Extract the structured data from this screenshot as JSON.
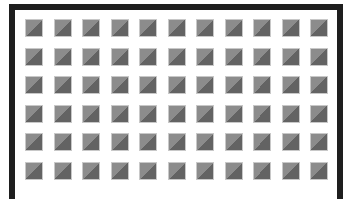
{
  "frame": {
    "border_color": "#1e1e1e",
    "background": "#ffffff"
  },
  "grid": {
    "columns": 11,
    "rows": 6,
    "tile_light_color": "#8c8c8c",
    "tile_dark_color": "#636363",
    "tile_icon": "diagonal-split-square-icon"
  }
}
